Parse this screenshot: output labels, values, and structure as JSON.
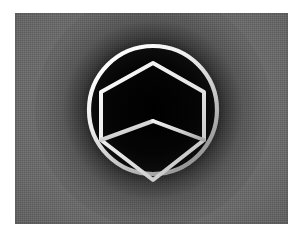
{
  "image": {
    "title": "Isometric cube emblem",
    "description": "A white line-art isometric cube enclosed in a white circle, centered on a dark radial glow over a gray woven-texture panel.",
    "width": 304,
    "height": 238,
    "margin_color": "#ffffff"
  },
  "panel": {
    "name": "textured gray panel",
    "base_color": "#6e6e6e",
    "texture": "fine woven crosshatch",
    "left": 15,
    "top": 13,
    "width": 273,
    "height": 211
  },
  "glow": {
    "name": "dark radial vignette",
    "color": "#000000",
    "center_x": 138,
    "center_y": 97,
    "radius": 118
  },
  "emblem": {
    "name": "cube-in-circle logo",
    "stroke_color": "#f2f2f2",
    "fill_color": "#0a0a0a",
    "center_x": 138,
    "center_y": 97,
    "circle": {
      "name": "outer ring",
      "radius": 64,
      "stroke_width": 4.2
    },
    "cube": {
      "name": "isometric cube wireframe",
      "stroke_width": 4.0,
      "vertices": {
        "top": [
          138,
          50
        ],
        "upper_right": [
          189,
          79
        ],
        "lower_right": [
          189,
          127
        ],
        "bottom": [
          138,
          167
        ],
        "lower_left": [
          86,
          127
        ],
        "upper_left": [
          86,
          79
        ],
        "center": [
          138,
          108
        ]
      },
      "inner_edges": [
        "center-to-top",
        "center-to-lower-left",
        "center-to-lower-right"
      ]
    }
  }
}
